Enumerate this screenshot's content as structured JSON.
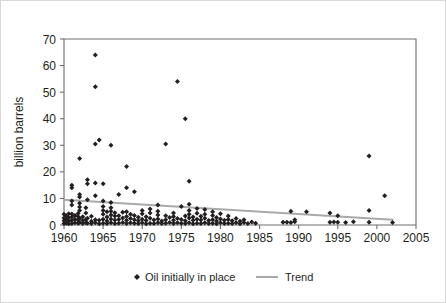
{
  "chart_data": {
    "type": "scatter",
    "title": "",
    "xlabel": "",
    "ylabel": "billion barrels",
    "xlim": [
      1960,
      2005
    ],
    "ylim": [
      0,
      70
    ],
    "xticks": [
      1960,
      1965,
      1970,
      1975,
      1980,
      1985,
      1990,
      1995,
      2000,
      2005
    ],
    "yticks": [
      0,
      10,
      20,
      30,
      40,
      50,
      60,
      70
    ],
    "grid": false,
    "legend_position": "bottom-center",
    "series": [
      {
        "name": "Oil initially in place",
        "type": "scatter",
        "marker": "diamond",
        "color": "#231f20",
        "points": [
          [
            1960.0,
            0.6
          ],
          [
            1960.0,
            1.6
          ],
          [
            1960.0,
            2.6
          ],
          [
            1960.0,
            4.0
          ],
          [
            1960.3,
            0.7
          ],
          [
            1960.3,
            2.0
          ],
          [
            1960.3,
            3.4
          ],
          [
            1960.6,
            0.5
          ],
          [
            1960.6,
            1.5
          ],
          [
            1960.6,
            2.7
          ],
          [
            1960.6,
            4.2
          ],
          [
            1961.0,
            0.6
          ],
          [
            1961.0,
            1.8
          ],
          [
            1961.0,
            3.0
          ],
          [
            1961.0,
            4.1
          ],
          [
            1961.0,
            7.5
          ],
          [
            1961.0,
            9.0
          ],
          [
            1961.0,
            14.0
          ],
          [
            1961.0,
            15.0
          ],
          [
            1961.4,
            0.8
          ],
          [
            1961.4,
            2.2
          ],
          [
            1961.4,
            3.6
          ],
          [
            1961.8,
            0.7
          ],
          [
            1961.8,
            1.9
          ],
          [
            1961.8,
            3.2
          ],
          [
            1961.8,
            4.3
          ],
          [
            1962.0,
            0.9
          ],
          [
            1962.0,
            2.4
          ],
          [
            1962.0,
            5.5
          ],
          [
            1962.0,
            6.8
          ],
          [
            1962.0,
            8.2
          ],
          [
            1962.0,
            10.5
          ],
          [
            1962.0,
            11.5
          ],
          [
            1962.0,
            25.0
          ],
          [
            1962.4,
            0.6
          ],
          [
            1962.4,
            1.7
          ],
          [
            1962.4,
            3.1
          ],
          [
            1962.8,
            0.8
          ],
          [
            1962.8,
            2.1
          ],
          [
            1962.8,
            4.5
          ],
          [
            1962.8,
            6.5
          ],
          [
            1963.0,
            0.7
          ],
          [
            1963.0,
            2.5
          ],
          [
            1963.0,
            9.5
          ],
          [
            1963.0,
            15.5
          ],
          [
            1963.0,
            17.0
          ],
          [
            1963.5,
            0.6
          ],
          [
            1963.5,
            1.4
          ],
          [
            1963.5,
            3.3
          ],
          [
            1964.0,
            0.8
          ],
          [
            1964.0,
            2.0
          ],
          [
            1964.0,
            11.0
          ],
          [
            1964.0,
            15.8
          ],
          [
            1964.0,
            30.5
          ],
          [
            1964.0,
            52.0
          ],
          [
            1964.0,
            64.0
          ],
          [
            1964.5,
            0.5
          ],
          [
            1964.5,
            1.8
          ],
          [
            1964.5,
            32.0
          ],
          [
            1965.0,
            0.7
          ],
          [
            1965.0,
            2.2
          ],
          [
            1965.0,
            4.0
          ],
          [
            1965.0,
            5.5
          ],
          [
            1965.0,
            7.0
          ],
          [
            1965.0,
            9.0
          ],
          [
            1965.0,
            15.5
          ],
          [
            1965.5,
            0.6
          ],
          [
            1965.5,
            1.5
          ],
          [
            1965.5,
            3.0
          ],
          [
            1965.5,
            5.0
          ],
          [
            1966.0,
            0.8
          ],
          [
            1966.0,
            2.3
          ],
          [
            1966.0,
            3.8
          ],
          [
            1966.0,
            5.2
          ],
          [
            1966.0,
            6.5
          ],
          [
            1966.0,
            8.5
          ],
          [
            1966.0,
            30.0
          ],
          [
            1966.5,
            0.6
          ],
          [
            1966.5,
            1.9
          ],
          [
            1966.5,
            3.4
          ],
          [
            1966.5,
            4.6
          ],
          [
            1967.0,
            0.7
          ],
          [
            1967.0,
            2.1
          ],
          [
            1967.0,
            3.5
          ],
          [
            1967.0,
            11.5
          ],
          [
            1967.5,
            0.9
          ],
          [
            1967.5,
            2.6
          ],
          [
            1967.5,
            4.8
          ],
          [
            1968.0,
            0.6
          ],
          [
            1968.0,
            1.8
          ],
          [
            1968.0,
            3.2
          ],
          [
            1968.0,
            5.0
          ],
          [
            1968.0,
            14.0
          ],
          [
            1968.0,
            22.0
          ],
          [
            1968.5,
            0.8
          ],
          [
            1968.5,
            2.4
          ],
          [
            1968.5,
            4.0
          ],
          [
            1969.0,
            0.7
          ],
          [
            1969.0,
            2.0
          ],
          [
            1969.0,
            3.6
          ],
          [
            1969.0,
            12.5
          ],
          [
            1969.5,
            0.6
          ],
          [
            1969.5,
            1.6
          ],
          [
            1969.5,
            2.9
          ],
          [
            1970.0,
            0.8
          ],
          [
            1970.0,
            2.2
          ],
          [
            1970.0,
            4.2
          ],
          [
            1970.0,
            5.5
          ],
          [
            1970.5,
            0.5
          ],
          [
            1970.5,
            1.7
          ],
          [
            1970.5,
            3.1
          ],
          [
            1971.0,
            0.7
          ],
          [
            1971.0,
            2.5
          ],
          [
            1971.0,
            4.5
          ],
          [
            1971.0,
            6.0
          ],
          [
            1971.5,
            0.6
          ],
          [
            1971.5,
            1.9
          ],
          [
            1972.0,
            0.8
          ],
          [
            1972.0,
            2.3
          ],
          [
            1972.0,
            3.8
          ],
          [
            1972.0,
            5.2
          ],
          [
            1972.0,
            7.5
          ],
          [
            1972.5,
            0.6
          ],
          [
            1972.5,
            1.5
          ],
          [
            1973.0,
            0.7
          ],
          [
            1973.0,
            2.0
          ],
          [
            1973.0,
            3.5
          ],
          [
            1973.0,
            30.5
          ],
          [
            1973.5,
            0.9
          ],
          [
            1973.5,
            2.8
          ],
          [
            1974.0,
            0.6
          ],
          [
            1974.0,
            1.8
          ],
          [
            1974.0,
            3.2
          ],
          [
            1974.0,
            4.5
          ],
          [
            1974.5,
            0.8
          ],
          [
            1974.5,
            2.4
          ],
          [
            1974.5,
            54.0
          ],
          [
            1975.0,
            0.7
          ],
          [
            1975.0,
            2.1
          ],
          [
            1975.0,
            7.0
          ],
          [
            1975.5,
            0.6
          ],
          [
            1975.5,
            1.6
          ],
          [
            1975.5,
            3.4
          ],
          [
            1975.5,
            40.0
          ],
          [
            1976.0,
            0.8
          ],
          [
            1976.0,
            2.6
          ],
          [
            1976.0,
            4.0
          ],
          [
            1976.0,
            5.5
          ],
          [
            1976.0,
            7.8
          ],
          [
            1976.0,
            16.5
          ],
          [
            1976.5,
            0.5
          ],
          [
            1976.5,
            1.8
          ],
          [
            1976.5,
            3.0
          ],
          [
            1977.0,
            0.7
          ],
          [
            1977.0,
            2.2
          ],
          [
            1977.0,
            4.4
          ],
          [
            1977.0,
            6.2
          ],
          [
            1977.5,
            0.6
          ],
          [
            1977.5,
            1.9
          ],
          [
            1977.5,
            3.3
          ],
          [
            1978.0,
            0.8
          ],
          [
            1978.0,
            2.5
          ],
          [
            1978.0,
            4.0
          ],
          [
            1978.0,
            5.8
          ],
          [
            1978.5,
            0.6
          ],
          [
            1978.5,
            1.7
          ],
          [
            1979.0,
            0.7
          ],
          [
            1979.0,
            2.0
          ],
          [
            1979.0,
            3.6
          ],
          [
            1979.0,
            5.0
          ],
          [
            1979.5,
            0.5
          ],
          [
            1979.5,
            1.5
          ],
          [
            1979.5,
            2.8
          ],
          [
            1980.0,
            0.8
          ],
          [
            1980.0,
            2.3
          ],
          [
            1980.0,
            4.2
          ],
          [
            1980.5,
            0.6
          ],
          [
            1980.5,
            1.8
          ],
          [
            1981.0,
            0.7
          ],
          [
            1981.0,
            2.1
          ],
          [
            1981.0,
            3.4
          ],
          [
            1981.5,
            0.6
          ],
          [
            1981.5,
            1.6
          ],
          [
            1982.0,
            0.8
          ],
          [
            1982.0,
            2.4
          ],
          [
            1982.5,
            0.5
          ],
          [
            1982.5,
            1.4
          ],
          [
            1983.0,
            0.9
          ],
          [
            1983.0,
            2.0
          ],
          [
            1983.5,
            0.6
          ],
          [
            1984.0,
            1.1
          ],
          [
            1984.5,
            0.7
          ],
          [
            1988.0,
            1.0
          ],
          [
            1988.5,
            1.0
          ],
          [
            1989.0,
            0.9
          ],
          [
            1989.0,
            5.2
          ],
          [
            1989.5,
            1.2
          ],
          [
            1989.5,
            2.0
          ],
          [
            1991.0,
            5.0
          ],
          [
            1994.0,
            1.0
          ],
          [
            1994.0,
            4.5
          ],
          [
            1994.5,
            1.1
          ],
          [
            1995.0,
            1.0
          ],
          [
            1995.0,
            3.5
          ],
          [
            1996.0,
            0.9
          ],
          [
            1997.0,
            1.2
          ],
          [
            1999.0,
            1.0
          ],
          [
            1999.0,
            5.5
          ],
          [
            1999.0,
            26.0
          ],
          [
            2001.0,
            11.0
          ],
          [
            2002.0,
            0.9
          ]
        ]
      },
      {
        "name": "Trend",
        "type": "line",
        "color": "#a7a9ac",
        "points": [
          [
            1960,
            9.5
          ],
          [
            2002,
            2.0
          ]
        ]
      }
    ],
    "legend": [
      {
        "label": "Oil initially in place",
        "marker": "diamond",
        "color": "#231f20"
      },
      {
        "label": "Trend",
        "marker": "line",
        "color": "#a7a9ac"
      }
    ]
  },
  "axes": {
    "y_title": "billion barrels",
    "x_tick_labels": [
      "1960",
      "1965",
      "1970",
      "1975",
      "1980",
      "1985",
      "1990",
      "1995",
      "2000",
      "2005"
    ],
    "y_tick_labels": [
      "0",
      "10",
      "20",
      "30",
      "40",
      "50",
      "60",
      "70"
    ]
  },
  "legend": {
    "series_label": "Oil initially in place",
    "trend_label": "Trend"
  },
  "colors": {
    "marker": "#231f20",
    "trend": "#a7a9ac",
    "axis": "#6d6e71",
    "frame": "#d9d9d9",
    "background": "#ffffff"
  }
}
